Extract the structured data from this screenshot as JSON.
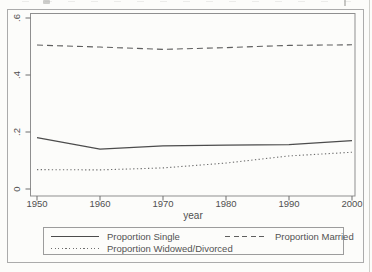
{
  "figure": {
    "background": "#fcfcfa",
    "frame_color": "#ababab",
    "plot_border_color": "#8f8f8f",
    "tick_color": "#6e6e6e",
    "text_color": "#4f4f4f",
    "legend_border_color": "#9c9c9c"
  },
  "chart_data": {
    "type": "line",
    "title": "",
    "xlabel": "year",
    "ylabel": "",
    "grid": false,
    "legend_position": "bottom",
    "xlim": [
      1949,
      2000.5
    ],
    "ylim": [
      -0.025,
      0.625
    ],
    "x": [
      1950,
      1960,
      1970,
      1980,
      1990,
      2000
    ],
    "series": [
      {
        "name": "Proportion Single",
        "style": "solid",
        "color": "#4c4c4c",
        "values": [
          0.18,
          0.14,
          0.151,
          0.154,
          0.156,
          0.17
        ]
      },
      {
        "name": "Proportion Married",
        "style": "dashed",
        "color": "#5e5e5e",
        "values": [
          0.505,
          0.498,
          0.49,
          0.496,
          0.504,
          0.506
        ]
      },
      {
        "name": "Proportion Widowed/Divorced",
        "style": "dotted",
        "color": "#6e6e6e",
        "values": [
          0.068,
          0.067,
          0.074,
          0.091,
          0.116,
          0.129
        ]
      }
    ],
    "xticks": [
      {
        "value": 1950,
        "label": "1950"
      },
      {
        "value": 1960,
        "label": "1960"
      },
      {
        "value": 1970,
        "label": "1970"
      },
      {
        "value": 1980,
        "label": "1980"
      },
      {
        "value": 1990,
        "label": "1990"
      },
      {
        "value": 2000,
        "label": "2000"
      }
    ],
    "yticks": [
      {
        "value": 0,
        "label": "0"
      },
      {
        "value": 0.2,
        "label": ".2"
      },
      {
        "value": 0.4,
        "label": ".4"
      },
      {
        "value": 0.6,
        "label": ".6"
      }
    ]
  }
}
